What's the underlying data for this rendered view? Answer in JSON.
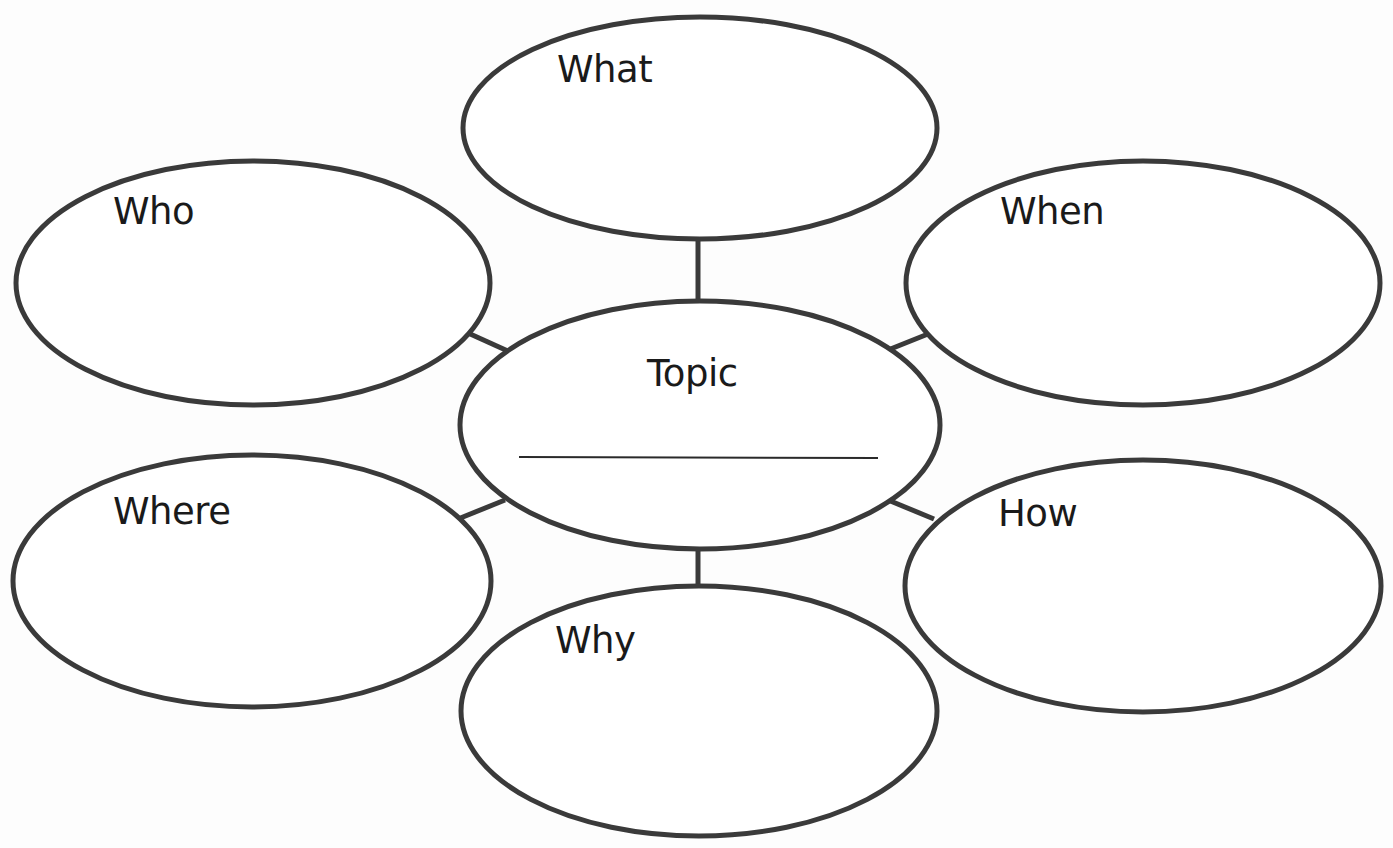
{
  "diagram": {
    "type": "5W1H graphic organizer",
    "center": {
      "label": "Topic",
      "has_answer_line": true
    },
    "nodes": [
      {
        "id": "what",
        "label": "What"
      },
      {
        "id": "who",
        "label": "Who"
      },
      {
        "id": "when",
        "label": "When"
      },
      {
        "id": "where",
        "label": "Where"
      },
      {
        "id": "how",
        "label": "How"
      },
      {
        "id": "why",
        "label": "Why"
      }
    ],
    "edges": [
      {
        "from": "topic",
        "to": "what"
      },
      {
        "from": "topic",
        "to": "who"
      },
      {
        "from": "topic",
        "to": "when"
      },
      {
        "from": "topic",
        "to": "where"
      },
      {
        "from": "topic",
        "to": "how"
      },
      {
        "from": "topic",
        "to": "why"
      }
    ],
    "colors": {
      "stroke": "#3a3a3a",
      "text": "#1a1a1a",
      "background": "#ffffff"
    }
  }
}
